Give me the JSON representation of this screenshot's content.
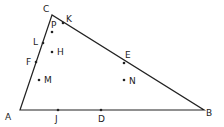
{
  "diagram": {
    "type": "geometry-triangle",
    "stroke_color": "#222222",
    "vertices": [
      {
        "label": "A",
        "x": 20,
        "y": 110,
        "lx": 5,
        "ly": 120
      },
      {
        "label": "B",
        "x": 204,
        "y": 110,
        "lx": 206,
        "ly": 116
      },
      {
        "label": "C",
        "x": 52,
        "y": 15,
        "lx": 43,
        "ly": 12
      }
    ],
    "points": [
      {
        "label": "K",
        "x": 63,
        "y": 23,
        "lx": 66,
        "ly": 22
      },
      {
        "label": "P",
        "x": 52,
        "y": 32,
        "lx": 51,
        "ly": 28
      },
      {
        "label": "L",
        "x": 43,
        "y": 43,
        "lx": 33,
        "ly": 45
      },
      {
        "label": "H",
        "x": 52,
        "y": 52,
        "lx": 57,
        "ly": 55
      },
      {
        "label": "F",
        "x": 36,
        "y": 62,
        "lx": 26,
        "ly": 65
      },
      {
        "label": "M",
        "x": 39,
        "y": 80,
        "lx": 44,
        "ly": 83
      },
      {
        "label": "E",
        "x": 124,
        "y": 63,
        "lx": 125,
        "ly": 58
      },
      {
        "label": "N",
        "x": 124,
        "y": 80,
        "lx": 129,
        "ly": 84
      },
      {
        "label": "J",
        "x": 58,
        "y": 110,
        "lx": 55,
        "ly": 122
      },
      {
        "label": "D",
        "x": 101,
        "y": 110,
        "lx": 98,
        "ly": 122
      }
    ]
  }
}
